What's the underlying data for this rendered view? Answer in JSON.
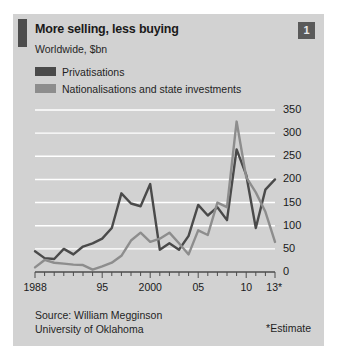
{
  "figure": {
    "badge": "1",
    "title": "More selling, less buying",
    "subtitle": "Worldwide, $bn",
    "source_line1": "Source: William Megginson",
    "source_line2": "University of Oklahoma",
    "estimate_note": "*Estimate",
    "accent_color": "#4d4d4d",
    "panel_color": "#d2d2d2"
  },
  "legend": {
    "items": [
      {
        "label": "Privatisations",
        "color": "#4a4a4a"
      },
      {
        "label": "Nationalisations and state investments",
        "color": "#8d8d8d"
      }
    ]
  },
  "chart_data": {
    "type": "line",
    "title": "More selling, less buying",
    "subtitle": "Worldwide, $bn",
    "xlabel": "",
    "ylabel": "$bn",
    "ylim": [
      0,
      350
    ],
    "yticks": [
      0,
      50,
      100,
      150,
      200,
      250,
      300,
      350
    ],
    "ytick_labels": [
      "0",
      "50",
      "100",
      "150",
      "200",
      "250",
      "300",
      "350"
    ],
    "grid": true,
    "grid_color": "#ffffff",
    "legend_position": "top-left",
    "x": [
      1988,
      1989,
      1990,
      1991,
      1992,
      1993,
      1994,
      1995,
      1996,
      1997,
      1998,
      1999,
      2000,
      2001,
      2002,
      2003,
      2004,
      2005,
      2006,
      2007,
      2008,
      2009,
      2010,
      2011,
      2012,
      2013
    ],
    "xtick_labels": [
      "1988",
      "",
      "",
      "",
      "",
      "",
      "",
      "95",
      "",
      "",
      "",
      "",
      "2000",
      "",
      "",
      "",
      "",
      "05",
      "",
      "",
      "",
      "",
      "10",
      "",
      "",
      "13*"
    ],
    "xtick_shown": [
      "1988",
      "95",
      "2000",
      "05",
      "10",
      "13*"
    ],
    "series": [
      {
        "name": "Privatisations",
        "color": "#4a4a4a",
        "values": [
          45,
          30,
          28,
          50,
          38,
          55,
          62,
          72,
          95,
          170,
          148,
          142,
          190,
          48,
          62,
          48,
          78,
          145,
          122,
          140,
          112,
          265,
          210,
          95,
          178,
          200
        ]
      },
      {
        "name": "Nationalisations and state investments",
        "color": "#8d8d8d",
        "values": [
          10,
          26,
          20,
          18,
          16,
          15,
          5,
          12,
          20,
          35,
          68,
          85,
          65,
          72,
          85,
          62,
          38,
          90,
          80,
          150,
          140,
          325,
          205,
          172,
          130,
          65
        ]
      }
    ],
    "annotations": [
      "*Estimate"
    ]
  }
}
